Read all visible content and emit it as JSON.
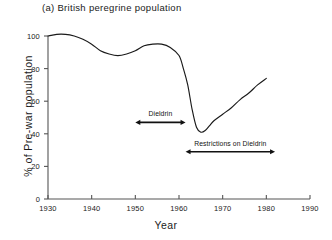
{
  "chart_data": {
    "type": "line",
    "title": "(a)  British peregrine population",
    "xlabel": "Year",
    "ylabel": "% of Pre-war population",
    "xlim": [
      1930,
      1990
    ],
    "ylim": [
      0,
      100
    ],
    "xticks": [
      1930,
      1940,
      1950,
      1960,
      1970,
      1980,
      1990
    ],
    "xtick_labels": [
      "1930",
      "1940",
      "1950",
      "1960",
      "1970",
      "1980",
      "1990"
    ],
    "yticks": [
      0,
      20,
      40,
      60,
      80,
      100
    ],
    "ytick_labels": [
      "0",
      "20",
      "40",
      "60",
      "80",
      "100"
    ],
    "grid": false,
    "legend": false,
    "line_color": "#1a1a1a",
    "series": [
      {
        "name": "British peregrine population",
        "x": [
          1930,
          1932,
          1934,
          1936,
          1938,
          1940,
          1942,
          1944,
          1946,
          1948,
          1950,
          1952,
          1954,
          1956,
          1958,
          1960,
          1961,
          1962,
          1963,
          1964,
          1965,
          1966,
          1967,
          1968,
          1970,
          1972,
          1974,
          1976,
          1978,
          1980
        ],
        "values": [
          100,
          101,
          101,
          100,
          98,
          95,
          91,
          89,
          88,
          89,
          91,
          94,
          95,
          95,
          93,
          88,
          80,
          70,
          55,
          44,
          41,
          42,
          45,
          48,
          52,
          56,
          61,
          65,
          70,
          74
        ]
      }
    ],
    "annotations": [
      {
        "label": "Dieldrin",
        "type": "double-arrow",
        "x_start": 1950,
        "x_end": 1961.5,
        "y": 47
      },
      {
        "label": "Restrictions on Dieldrin",
        "type": "double-arrow",
        "x_start": 1961.5,
        "x_end": 1982,
        "y": 29
      }
    ]
  }
}
